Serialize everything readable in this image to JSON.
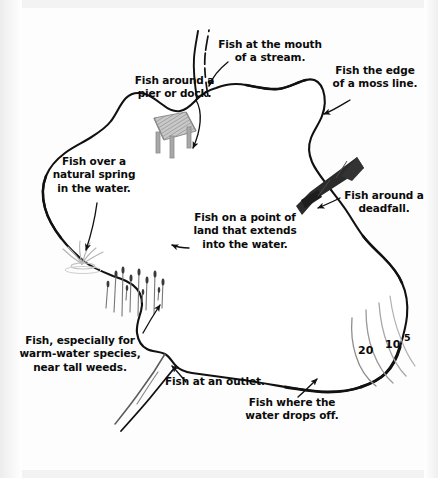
{
  "diagram": {
    "background_color": "#ffffff",
    "ink_color": "#111111",
    "weed_color": "#6d6d6d",
    "deadfall_color": "#2b2b2b",
    "dock_color": "#b9b9b9"
  },
  "captions": [
    {
      "id": "mouth-of-stream",
      "text": "Fish at the mouth\nof a stream.",
      "align": "center"
    },
    {
      "id": "moss-line",
      "text": "Fish the edge\nof a moss line.",
      "align": "center"
    },
    {
      "id": "pier-or-dock",
      "text": "Fish around a\npier or dock.",
      "align": "center"
    },
    {
      "id": "natural-spring",
      "text": "Fish over a\nnatural spring\nin the water.",
      "align": "center"
    },
    {
      "id": "deadfall",
      "text": "Fish around a\ndeadfall.",
      "align": "center"
    },
    {
      "id": "point-of-land",
      "text": "Fish on a point of\nland that extends\ninto the water.",
      "align": "center"
    },
    {
      "id": "tall-weeds",
      "text": "Fish, especially for\nwarm-water species,\nnear tall weeds.",
      "align": "center"
    },
    {
      "id": "outlet",
      "text": "Fish at an outlet.",
      "align": "left"
    },
    {
      "id": "water-drops-off",
      "text": "Fish where the\nwater drops off.",
      "align": "center"
    }
  ],
  "depth_contours": [
    {
      "id": "depth-20",
      "label": "20"
    },
    {
      "id": "depth-10",
      "label": "10"
    },
    {
      "id": "depth-5",
      "label": "5"
    }
  ],
  "features": [
    {
      "id": "dock",
      "name": "pier-or-dock"
    },
    {
      "id": "deadfall",
      "name": "deadfall-log"
    },
    {
      "id": "weeds",
      "name": "tall-weed-bed"
    },
    {
      "id": "spring",
      "name": "natural-spring"
    },
    {
      "id": "inlet-stream",
      "name": "inlet-stream"
    },
    {
      "id": "outlet-stream",
      "name": "outlet-stream"
    },
    {
      "id": "shoreline",
      "name": "lake-shoreline"
    }
  ]
}
